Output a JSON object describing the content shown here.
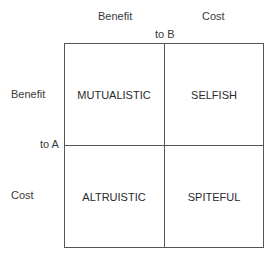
{
  "columns": {
    "header_benefit": "Benefit",
    "header_cost": "Cost",
    "axis_label": "to B"
  },
  "rows": {
    "header_benefit": "Benefit",
    "header_cost": "Cost",
    "axis_label": "to A"
  },
  "cells": {
    "benefit_benefit": "MUTUALISTIC",
    "benefit_cost": "SELFISH",
    "cost_benefit": "ALTRUISTIC",
    "cost_cost": "SPITEFUL"
  }
}
